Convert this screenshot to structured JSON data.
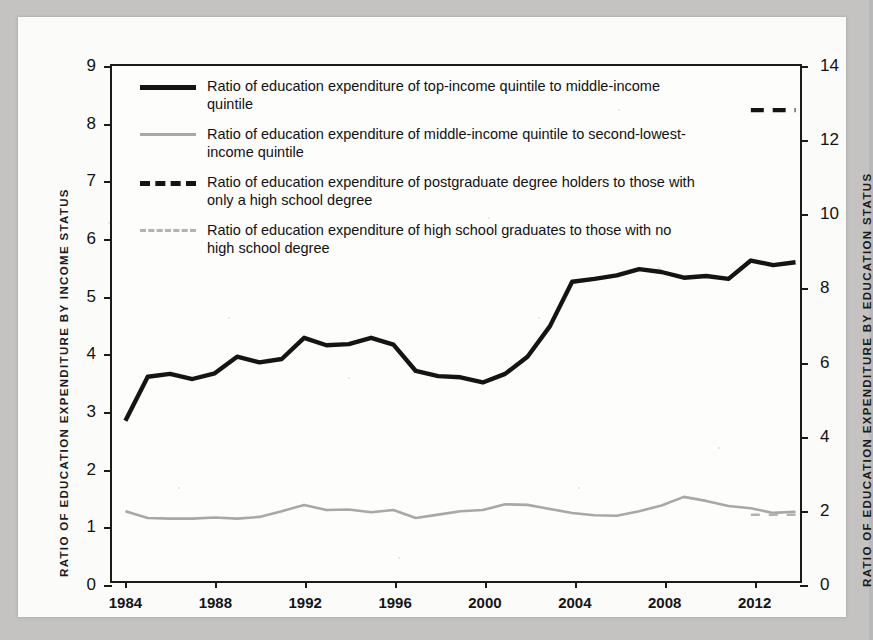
{
  "figure": {
    "background_color": "#c4c3c1",
    "page_color": "#fbfbfa"
  },
  "legend": {
    "position": "top-left-inside",
    "items": [
      {
        "style": "solid-dark",
        "label": "Ratio of education expenditure of top-income quintile to middle-income quintile"
      },
      {
        "style": "solid-gray",
        "label": "Ratio of education expenditure of middle-income quintile to second-lowest-income quintile"
      },
      {
        "style": "dashed-dark",
        "label": "Ratio of education expenditure of postgraduate degree holders to those with only a high school degree"
      },
      {
        "style": "dashed-gray",
        "label": "Ratio of education expenditure of high school graduates to those with no high school degree"
      }
    ]
  },
  "chart_data": {
    "type": "line",
    "title": "",
    "xlabel": "",
    "ylabel": "RATIO OF EDUCATION EXPENDITURE BY INCOME STATUS",
    "y2label": "RATIO OF EDUCATION EXPENDITURE BY EDUCATION STATUS",
    "grid": false,
    "legend_position": "upper left",
    "xlim": [
      1983.4,
      2014.2
    ],
    "ylim": [
      0,
      9
    ],
    "y2lim": [
      0,
      14
    ],
    "yticks": [
      0,
      1,
      2,
      3,
      4,
      5,
      6,
      7,
      8,
      9
    ],
    "ytick_labels": [
      "0",
      "1",
      "2",
      "3",
      "4",
      "5",
      "6",
      "7",
      "8",
      "9"
    ],
    "y2ticks": [
      0,
      2,
      4,
      6,
      8,
      10,
      12,
      14
    ],
    "y2tick_labels": [
      "0",
      "2",
      "4",
      "6",
      "8",
      "10",
      "12",
      "14"
    ],
    "xticks": [
      1984,
      1988,
      1992,
      1996,
      2000,
      2004,
      2008,
      2012
    ],
    "xtick_labels": [
      "1984",
      "1988",
      "1992",
      "1996",
      "2000",
      "2004",
      "2008",
      "2012"
    ],
    "series": [
      {
        "name": "Ratio of education expenditure of top-income quintile to middle-income quintile",
        "axis": "left",
        "style": "solid",
        "color": "#141414",
        "x": [
          1984,
          1985,
          1986,
          1987,
          1988,
          1989,
          1990,
          1991,
          1992,
          1993,
          1994,
          1995,
          1996,
          1997,
          1998,
          1999,
          2000,
          2001,
          2002,
          2003,
          2004,
          2005,
          2006,
          2007,
          2008,
          2009,
          2010,
          2011,
          2012,
          2013,
          2014
        ],
        "values": [
          2.8,
          3.57,
          3.62,
          3.53,
          3.63,
          3.92,
          3.82,
          3.88,
          4.25,
          4.12,
          4.14,
          4.25,
          4.13,
          3.67,
          3.58,
          3.56,
          3.47,
          3.62,
          3.92,
          4.45,
          5.23,
          5.28,
          5.34,
          5.45,
          5.4,
          5.3,
          5.33,
          5.28,
          5.6,
          5.52,
          5.57
        ]
      },
      {
        "name": "Ratio of education expenditure of middle-income quintile to second-lowest-income quintile",
        "axis": "left",
        "style": "solid",
        "color": "#a8a8a8",
        "x": [
          1984,
          1985,
          1986,
          1987,
          1988,
          1989,
          1990,
          1991,
          1992,
          1993,
          1994,
          1995,
          1996,
          1997,
          1998,
          1999,
          2000,
          2001,
          2002,
          2003,
          2004,
          2005,
          2006,
          2007,
          2008,
          2009,
          2010,
          2011,
          2012,
          2013,
          2014
        ],
        "values": [
          1.22,
          1.1,
          1.09,
          1.09,
          1.11,
          1.09,
          1.12,
          1.22,
          1.33,
          1.24,
          1.25,
          1.2,
          1.24,
          1.1,
          1.16,
          1.22,
          1.24,
          1.34,
          1.33,
          1.26,
          1.19,
          1.15,
          1.14,
          1.22,
          1.32,
          1.47,
          1.4,
          1.31,
          1.27,
          1.19,
          1.21
        ]
      },
      {
        "name": "Ratio of education expenditure of postgraduate degree holders to those with only a high school degree",
        "axis": "right",
        "style": "dashed",
        "color": "#141414",
        "x": [
          2012,
          2014
        ],
        "values": [
          12.8,
          12.8
        ]
      },
      {
        "name": "Ratio of education expenditure of high school graduates to those with no high school degree",
        "axis": "right",
        "style": "dashed",
        "color": "#b3b3b3",
        "x": [
          2012,
          2014
        ],
        "values": [
          1.8,
          1.8
        ]
      }
    ]
  }
}
